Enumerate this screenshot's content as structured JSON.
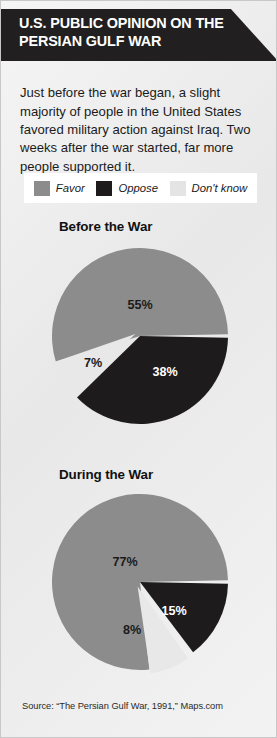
{
  "header": {
    "title": "U.S. PUBLIC OPINION ON THE\nPERSIAN GULF WAR",
    "band_color": "#211f1f"
  },
  "intro": {
    "text": "Just before the war began, a slight majority of people in the United States favored military action against Iraq. Two weeks after the war started, far more people supported it."
  },
  "legend": {
    "items": [
      {
        "label": "Favor",
        "color": "#8c8c8c",
        "key": "favor"
      },
      {
        "label": "Oppose",
        "color": "#1d1b1b",
        "key": "oppose"
      },
      {
        "label": "Don't know",
        "color": "#e4e4e4",
        "key": "dont-know"
      }
    ]
  },
  "colors": {
    "favor": "#8c8c8c",
    "oppose": "#1d1b1b",
    "dont_know": "#e8e8e8",
    "background": "#e9e9e9",
    "separator": "#ffffff"
  },
  "chart_data": [
    {
      "type": "pie",
      "title": "Before the War",
      "categories": [
        "Favor",
        "Oppose",
        "Don't know"
      ],
      "values": [
        55,
        38,
        7
      ],
      "labels": [
        "55%",
        "38%",
        "7%"
      ],
      "colors": [
        "#8c8c8c",
        "#1d1b1b",
        "#e8e8e8"
      ],
      "units": "percent",
      "legend_position": "top",
      "grid": false
    },
    {
      "type": "pie",
      "title": "During the War",
      "categories": [
        "Favor",
        "Oppose",
        "Don't know"
      ],
      "values": [
        77,
        15,
        8
      ],
      "labels": [
        "77%",
        "15%",
        "8%"
      ],
      "colors": [
        "#8c8c8c",
        "#1d1b1b",
        "#e8e8e8"
      ],
      "units": "percent",
      "legend_position": "top",
      "grid": false
    }
  ],
  "footer": {
    "source": "Source: “The Persian Gulf War, 1991,” Maps.com"
  }
}
